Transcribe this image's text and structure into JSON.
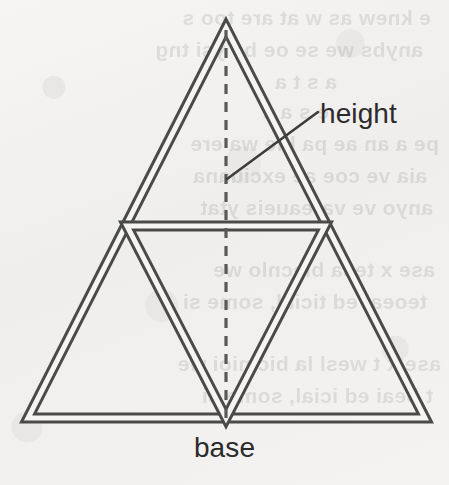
{
  "figure": {
    "kind": "geometry-diagram",
    "canvas": {
      "width": 449,
      "height": 485
    },
    "background_color": "#f3f2f0",
    "ink_color": "#4a4a4a",
    "label_color": "#2b2b2b",
    "labels": {
      "height": "height",
      "base": "base"
    },
    "shapes": {
      "outer_triangle": {
        "name": "outer-triangle",
        "style": "double-line",
        "apex": {
          "x": 226,
          "y": 28
        },
        "bottom_left": {
          "x": 28,
          "y": 418
        },
        "bottom_right": {
          "x": 425,
          "y": 418
        }
      },
      "inner_inverted_triangle": {
        "name": "inner-inverted-triangle",
        "style": "double-line",
        "left_midpoint": {
          "x": 127,
          "y": 226
        },
        "right_midpoint": {
          "x": 325,
          "y": 226
        },
        "bottom_apex": {
          "x": 226,
          "y": 418
        }
      },
      "midline": {
        "name": "horizontal-midline",
        "style": "double-line",
        "start": {
          "x": 127,
          "y": 226
        },
        "end": {
          "x": 325,
          "y": 226
        }
      },
      "height_line": {
        "name": "height-altitude-line",
        "style": "dashed",
        "start": {
          "x": 226,
          "y": 30
        },
        "end": {
          "x": 226,
          "y": 420
        },
        "dash": "10 8"
      },
      "height_leader": {
        "name": "height-leader-line",
        "style": "solid",
        "start": {
          "x": 227,
          "y": 179
        },
        "end": {
          "x": 318,
          "y": 112
        }
      }
    },
    "bleed_through_lines": [
      {
        "top": 2,
        "left": 18,
        "text": "e knew as w at are too s"
      },
      {
        "top": 34,
        "left": 26,
        "text": "anybs we se oe be ysi tng"
      },
      {
        "top": 66,
        "left": 112,
        "text": "a s  t a"
      },
      {
        "top": 96,
        "left": 120,
        "text": "e s a e"
      },
      {
        "top": 128,
        "left": 10,
        "text": "pe    a an ae pa hie wa ere"
      },
      {
        "top": 160,
        "left": 22,
        "text": "aia ve coe  ae exciuana"
      },
      {
        "top": 192,
        "left": 16,
        "text": "anyo  ve  vareaueis ytat"
      },
      {
        "top": 254,
        "left": 14,
        "text": "ase x  tesa blecnlo we"
      },
      {
        "top": 286,
        "left": 22,
        "text": "teoeai ed ticial, some si"
      },
      {
        "top": 348,
        "left": 8,
        "text": "ase x  t wesl la bicmioi  we"
      },
      {
        "top": 380,
        "left": 16,
        "text": "t beai ed  icial, some si"
      }
    ]
  }
}
